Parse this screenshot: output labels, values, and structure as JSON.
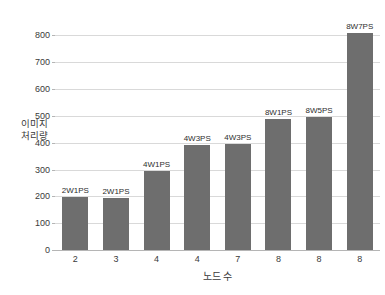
{
  "chart_data": {
    "type": "bar",
    "title": "",
    "subtitle": "",
    "xlabel": "노드 수",
    "ylabel": "이미지\n처리량",
    "categories": [
      "2",
      "3",
      "4",
      "4",
      "7",
      "8",
      "8",
      "8"
    ],
    "values": [
      197,
      193,
      293,
      390,
      397,
      490,
      495,
      808
    ],
    "point_labels": [
      "2W1PS",
      "2W1PS",
      "4W1PS",
      "4W3PS",
      "4W3PS",
      "8W1PS",
      "8W5PS",
      "8W7PS"
    ],
    "ylim": [
      0,
      850
    ],
    "yticks": [
      0,
      100,
      200,
      300,
      400,
      500,
      600,
      700,
      800
    ],
    "ytick_labels": [
      "0",
      "100",
      "200",
      "300",
      "400",
      "500",
      "600",
      "700",
      "800"
    ],
    "grid": "horizontal",
    "legend": "none",
    "bar_color": "#6e6e6e",
    "gridline_color": "#d9d9d9",
    "axis_color": "#b5b5b5",
    "background_color": "#ffffff",
    "text_color": "#3a3a3a"
  }
}
